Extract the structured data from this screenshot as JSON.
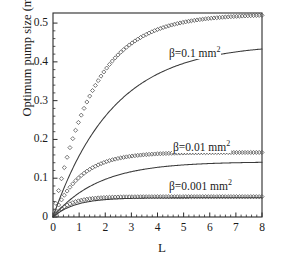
{
  "figure": {
    "title": "",
    "xlabel": "L",
    "ylabel": "Optimum pump size (mm)"
  },
  "axes": {
    "x_ticks": [
      "0",
      "1",
      "2",
      "3",
      "4",
      "5",
      "6",
      "7",
      "8"
    ],
    "y_ticks": [
      "0",
      "0.1",
      "0.2",
      "0.3",
      "0.4",
      "0.5"
    ]
  },
  "annotations": [
    {
      "name": "beta-0p1-label",
      "text": "β=0.1 mm",
      "exp": "2",
      "x": 168,
      "y": 45
    },
    {
      "name": "beta-0p01-label",
      "text": "β=0.01 mm",
      "exp": "2",
      "x": 172,
      "y": 139
    },
    {
      "name": "beta-0p001-label",
      "text": "β=0.001 mm",
      "exp": "2",
      "x": 168,
      "y": 178
    }
  ],
  "colors": {
    "axis": "#2a2a2a",
    "line": "#3a3a3a",
    "marker": "#4a4a4a",
    "background": "#ffffff"
  },
  "chart_data": {
    "type": "line",
    "title": "",
    "xlabel": "L",
    "ylabel": "Optimum pump size (mm)",
    "xlim": [
      0,
      8
    ],
    "ylim": [
      0,
      0.526
    ],
    "grid": false,
    "legend": "inline-annotations",
    "x": [
      0,
      0.1,
      0.2,
      0.3,
      0.4,
      0.5,
      0.6,
      0.8,
      1.0,
      1.2,
      1.4,
      1.6,
      1.8,
      2.0,
      2.25,
      2.5,
      2.75,
      3.0,
      3.25,
      3.5,
      3.75,
      4.0,
      4.5,
      5.0,
      5.5,
      6.0,
      6.5,
      7.0,
      7.5,
      8.0
    ],
    "series": [
      {
        "name": "β=0.1 mm² (markers)",
        "style": "open-diamond-markers",
        "model": "A*(1-exp(-L/tau))",
        "A": 0.523,
        "tau": 1.55,
        "values": [
          0,
          0.0327,
          0.0633,
          0.092,
          0.1188,
          0.144,
          0.1676,
          0.2104,
          0.2481,
          0.2813,
          0.3105,
          0.3361,
          0.3587,
          0.3785,
          0.3999,
          0.4177,
          0.4327,
          0.4452,
          0.4556,
          0.4643,
          0.4715,
          0.4776,
          0.4869,
          0.4934,
          0.498,
          0.5013,
          0.5036,
          0.5052,
          0.5063,
          0.5072
        ]
      },
      {
        "name": "β=0.1 mm² (line)",
        "style": "solid-line",
        "model": "A*(1-exp(-L/tau))",
        "A": 0.447,
        "tau": 2.3,
        "values": [
          0,
          0.019,
          0.0372,
          0.0546,
          0.0713,
          0.0873,
          0.1026,
          0.1314,
          0.1578,
          0.1819,
          0.2039,
          0.224,
          0.2423,
          0.259,
          0.2779,
          0.2945,
          0.3091,
          0.3219,
          0.3332,
          0.3431,
          0.3518,
          0.3595,
          0.3721,
          0.3818,
          0.3894,
          0.3953,
          0.3999,
          0.4034,
          0.4062,
          0.4083
        ]
      },
      {
        "name": "β=0.01 mm² (markers)",
        "style": "open-diamond-markers",
        "model": "A*(1-exp(-L/tau))",
        "A": 0.1665,
        "tau": 1.05,
        "values": [
          0,
          0.0151,
          0.029,
          0.0417,
          0.0534,
          0.0641,
          0.0739,
          0.0911,
          0.1055,
          0.1176,
          0.1277,
          0.1362,
          0.1433,
          0.1492,
          0.1553,
          0.1601,
          0.1639,
          0.1668,
          0.1691,
          0.1709,
          0.1723,
          0.1734,
          0.1749,
          0.1758,
          0.1762,
          0.1765,
          0.1766,
          0.1767,
          0.1767,
          0.1767
        ]
      },
      {
        "name": "β=0.01 mm² (line)",
        "style": "solid-line",
        "model": "A*(1-exp(-L/tau))",
        "A": 0.1425,
        "tau": 1.75,
        "values": [
          0,
          0.0079,
          0.0155,
          0.0228,
          0.0298,
          0.0366,
          0.0431,
          0.0554,
          0.0667,
          0.0771,
          0.0866,
          0.0954,
          0.1034,
          0.1108,
          0.1192,
          0.1266,
          0.1331,
          0.1389,
          0.1439,
          0.1484,
          0.1523,
          0.1558,
          0.1616,
          0.1661,
          0.1696,
          0.1723,
          0.1744,
          0.176,
          0.1773,
          0.1783
        ]
      },
      {
        "name": "β=0.001 mm² (markers)",
        "style": "open-diamond-markers",
        "model": "A*(1-exp(-L/tau))",
        "A": 0.0525,
        "tau": 0.62,
        "values": [
          0,
          0.0078,
          0.0147,
          0.0207,
          0.0261,
          0.0308,
          0.0349,
          0.0417,
          0.0469,
          0.0509,
          0.0539,
          0.0563,
          0.0581,
          0.0595,
          0.0609,
          0.0618,
          0.0625,
          0.063,
          0.0634,
          0.0637,
          0.0639,
          0.064,
          0.0642,
          0.0643,
          0.0644,
          0.0644,
          0.0644,
          0.0644,
          0.0644,
          0.0644
        ]
      },
      {
        "name": "β=0.001 mm² (line)",
        "style": "solid-line",
        "model": "A*(1-exp(-L/tau))",
        "A": 0.0495,
        "tau": 0.85,
        "values": [
          0,
          0.0055,
          0.0105,
          0.0151,
          0.0193,
          0.0231,
          0.0266,
          0.0327,
          0.0377,
          0.0419,
          0.0453,
          0.0481,
          0.0504,
          0.0524,
          0.0543,
          0.0559,
          0.0571,
          0.0581,
          0.0588,
          0.0594,
          0.0599,
          0.0603,
          0.0608,
          0.0611,
          0.0613,
          0.0614,
          0.0615,
          0.0615,
          0.0615,
          0.0615
        ]
      }
    ]
  }
}
